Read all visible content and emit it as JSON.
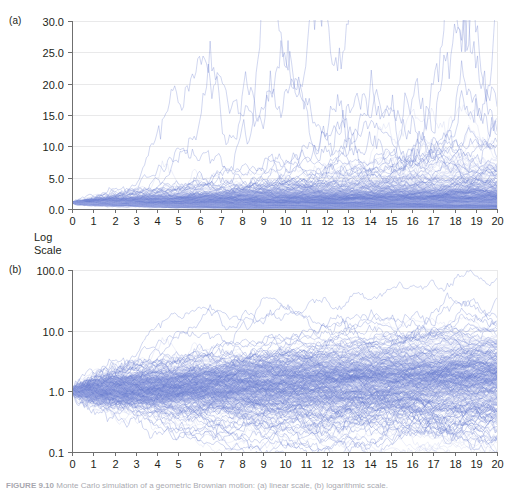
{
  "figure": {
    "panel_a_tag": "(a)",
    "panel_b_tag": "(b)",
    "log_scale_label_line1": "Log",
    "log_scale_label_line2": "Scale",
    "caption_prefix": "FIGURE 9.10",
    "caption_text": "Monte Carlo simulation of a geometric Brownian motion: (a) linear scale, (b) logarithmic scale."
  },
  "style": {
    "path_color": "#6a7fd0",
    "path_color_light": "#aab6e6",
    "grid_color": "#e9e9ea",
    "axis_color": "#6f6f6f",
    "text_color": "#231f20",
    "background": "#ffffff"
  },
  "chart_data": [
    {
      "id": "panel-a",
      "type": "line",
      "title": "",
      "subtitle": "",
      "xlabel": "",
      "ylabel": "",
      "scale": "linear",
      "grid": true,
      "legend": null,
      "n_series": 300,
      "x": [
        0,
        1,
        2,
        3,
        4,
        5,
        6,
        7,
        8,
        9,
        10,
        11,
        12,
        13,
        14,
        15,
        16,
        17,
        18,
        19,
        20
      ],
      "xlim": [
        0,
        20
      ],
      "ylim": [
        0,
        30
      ],
      "xticks": [
        0,
        1,
        2,
        3,
        4,
        5,
        6,
        7,
        8,
        9,
        10,
        11,
        12,
        13,
        14,
        15,
        16,
        17,
        18,
        19,
        20
      ],
      "xticklabels": [
        "0",
        "1",
        "2",
        "3",
        "4",
        "5",
        "6",
        "7",
        "8",
        "9",
        "10",
        "11",
        "12",
        "13",
        "14",
        "15",
        "16",
        "17",
        "18",
        "19",
        "20"
      ],
      "yticks": [
        0,
        5,
        10,
        15,
        20,
        25,
        30
      ],
      "yticklabels": [
        "0.0",
        "5.0",
        "10.0",
        "15.0",
        "20.0",
        "25.0",
        "30.0"
      ],
      "process": {
        "model": "geometric-brownian-motion",
        "start_value": 1.0,
        "drift": 0.055,
        "volatility": 0.25,
        "steps_per_unit": 12,
        "seed": 20250910
      },
      "summary": {
        "start_value": 1.0,
        "median_at_t20": 2.2,
        "p05_at_t20": 0.55,
        "p95_at_t20": 7.5,
        "max_observed_at_t20": 27.0,
        "note": "Fan of simulated paths all starting at 1.0 at t=0 and widening with time; bulk of mass below 5.0, rare excursions up to ~27."
      }
    },
    {
      "id": "panel-b",
      "type": "line",
      "title": "",
      "subtitle": "",
      "xlabel": "",
      "ylabel": "Log Scale",
      "scale": "log",
      "grid": true,
      "legend": null,
      "n_series": 300,
      "x": [
        0,
        1,
        2,
        3,
        4,
        5,
        6,
        7,
        8,
        9,
        10,
        11,
        12,
        13,
        14,
        15,
        16,
        17,
        18,
        19,
        20
      ],
      "xlim": [
        0,
        20
      ],
      "ylim": [
        0.1,
        100
      ],
      "xticks": [
        0,
        1,
        2,
        3,
        4,
        5,
        6,
        7,
        8,
        9,
        10,
        11,
        12,
        13,
        14,
        15,
        16,
        17,
        18,
        19,
        20
      ],
      "xticklabels": [
        "0",
        "1",
        "2",
        "3",
        "4",
        "5",
        "6",
        "7",
        "8",
        "9",
        "10",
        "11",
        "12",
        "13",
        "14",
        "15",
        "16",
        "17",
        "18",
        "19",
        "20"
      ],
      "yticks": [
        0.1,
        1.0,
        10.0,
        100.0
      ],
      "yticklabels": [
        "0.1",
        "1.0",
        "10.0",
        "100.0"
      ],
      "process": {
        "model": "geometric-brownian-motion",
        "start_value": 1.0,
        "drift": 0.055,
        "volatility": 0.25,
        "steps_per_unit": 12,
        "seed": 20250910
      },
      "summary": {
        "start_value": 1.0,
        "median_at_t20": 2.2,
        "p05_at_t20": 0.55,
        "p95_at_t20": 7.5,
        "max_observed_at_t20": 27.0,
        "note": "Same simulated paths rendered on a log vertical axis, producing a symmetric cone about 1.0 widening from t=0 to t=20."
      }
    }
  ]
}
